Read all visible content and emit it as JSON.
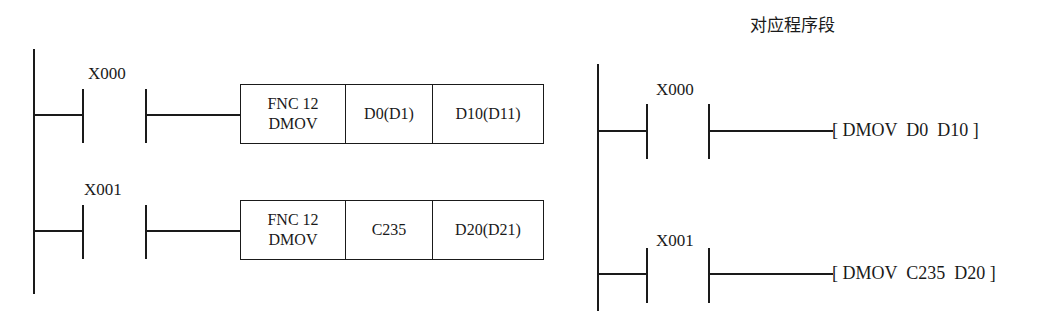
{
  "left_diagram": {
    "name": "Ladder diagram (FNC 12 DMOV)",
    "rungs": [
      {
        "contact": "X000",
        "instruction_box": {
          "function": "FNC 12",
          "mnemonic": "DMOV",
          "source": "D0(D1)",
          "destination": "D10(D11)"
        }
      },
      {
        "contact": "X001",
        "instruction_box": {
          "function": "FNC 12",
          "mnemonic": "DMOV",
          "source": "C235",
          "destination": "D20(D21)"
        }
      }
    ]
  },
  "right_diagram": {
    "title": "对应程序段",
    "rungs": [
      {
        "contact": "X000",
        "instruction": "[ DMOV  D0  D10 ]"
      },
      {
        "contact": "X001",
        "instruction": "[ DMOV  C235  D20 ]"
      }
    ]
  },
  "colors": {
    "line": "#1a1a1a",
    "background": "#ffffff"
  }
}
